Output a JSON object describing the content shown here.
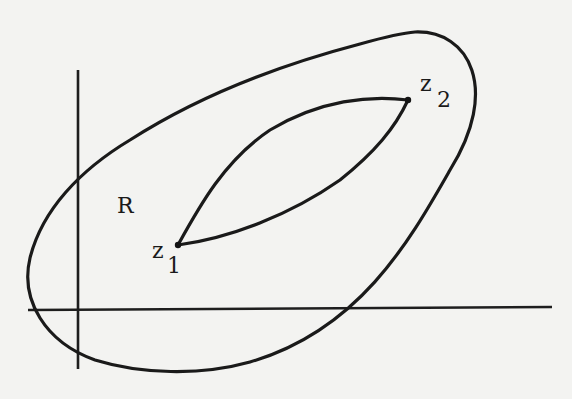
{
  "figure": {
    "type": "complex-plane contour diagram",
    "region_label": "R",
    "points": [
      {
        "name": "z",
        "subscript": "1"
      },
      {
        "name": "z",
        "subscript": "2"
      }
    ],
    "axes": {
      "horizontal": "real axis",
      "vertical": "imaginary axis"
    },
    "curves": [
      "outer closed contour enclosing region R",
      "two paths from z1 to z2 forming a closed lens"
    ],
    "colors": {
      "ink": "#1a1a1a",
      "paper": "#f3f3f1"
    }
  }
}
